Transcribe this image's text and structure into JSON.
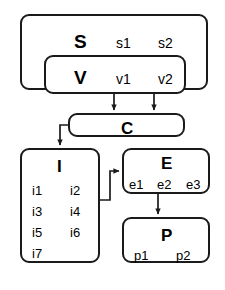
{
  "diagram": {
    "title": "",
    "background_color": "#ffffff",
    "stroke_color": "#1a1a1a",
    "text_color": "#000000",
    "nodes": [
      {
        "id": "S",
        "title": "S",
        "items": [
          "s1",
          "s2"
        ]
      },
      {
        "id": "V",
        "title": "V",
        "items": [
          "v1",
          "v2"
        ]
      },
      {
        "id": "C",
        "title": "C",
        "items": []
      },
      {
        "id": "I",
        "title": "I",
        "items": [
          "i1",
          "i2",
          "i3",
          "i4",
          "i5",
          "i6",
          "i7"
        ]
      },
      {
        "id": "E",
        "title": "E",
        "items": [
          "e1",
          "e2",
          "e3"
        ]
      },
      {
        "id": "P",
        "title": "P",
        "items": [
          "p1",
          "p2"
        ]
      }
    ],
    "edges": [
      {
        "from": "V",
        "to": "C",
        "label": ""
      },
      {
        "from": "V",
        "to": "C",
        "label": ""
      },
      {
        "from": "C",
        "to": "I",
        "label": ""
      },
      {
        "from": "I",
        "to": "E",
        "label": ""
      },
      {
        "from": "E",
        "to": "P",
        "label": ""
      }
    ]
  }
}
